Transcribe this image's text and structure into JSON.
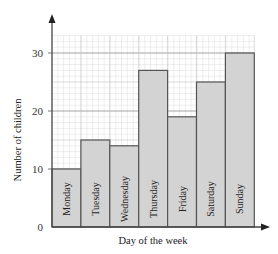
{
  "chart_data": {
    "type": "bar",
    "title": "",
    "xlabel": "Day of the week",
    "ylabel": "Number of children",
    "categories": [
      "Monday",
      "Tuesday",
      "Wednesday",
      "Thursday",
      "Friday",
      "Saturday",
      "Sunday"
    ],
    "values": [
      10,
      15,
      14,
      27,
      19,
      25,
      30
    ],
    "ylim": [
      0,
      33
    ],
    "yticks": [
      0,
      10,
      20,
      30
    ],
    "grid": true,
    "legend": null,
    "bar_labels_inside": true
  },
  "colors": {
    "bar_fill": "#d3d3d3",
    "bar_stroke": "#555555",
    "grid_major": "#aaaaaa",
    "grid_minor": "#dddddd",
    "axis": "#444444"
  }
}
